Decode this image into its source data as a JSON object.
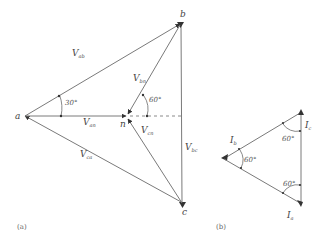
{
  "figure": {
    "panel_a": {
      "caption": "(a)",
      "nodes": {
        "a": "a",
        "b": "b",
        "c": "c",
        "n": "n"
      },
      "vectors": {
        "Vab": {
          "main": "V",
          "sub": "ab"
        },
        "Vca": {
          "main": "V",
          "sub": "ca"
        },
        "Vbc": {
          "main": "V",
          "sub": "bc"
        },
        "Van": {
          "main": "V",
          "sub": "an"
        },
        "Vbn": {
          "main": "V",
          "sub": "bn"
        },
        "Vcn": {
          "main": "V",
          "sub": "cn"
        }
      },
      "angles": {
        "a_angle": "30°",
        "n_angle": "60°"
      }
    },
    "panel_b": {
      "caption": "(b)",
      "currents": {
        "Ib": {
          "main": "I",
          "sub": "b"
        },
        "Ic": {
          "main": "I",
          "sub": "c"
        },
        "Ia": {
          "main": "I",
          "sub": "a"
        }
      },
      "angles": {
        "left": "60°",
        "top_right": "60°",
        "bottom_right": "60°"
      }
    }
  },
  "colors": {
    "line": "#7a7a7a",
    "text": "#444444",
    "background": "#ffffff"
  }
}
